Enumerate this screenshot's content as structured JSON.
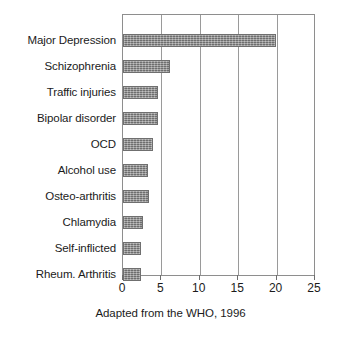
{
  "chart_data": {
    "type": "bar",
    "orientation": "horizontal",
    "title": "",
    "subtitle": "",
    "xlabel": "",
    "ylabel": "",
    "categories": [
      "Major Depression",
      "Schizophrenia",
      "Traffic injuries",
      "Bipolar disorder",
      "OCD",
      "Alcohol use",
      "Osteo-arthritis",
      "Chlamydia",
      "Self-inflicted",
      "Rheum. Arthritis"
    ],
    "values": [
      19.9,
      6.1,
      4.5,
      4.6,
      3.9,
      3.3,
      3.4,
      2.6,
      2.4,
      2.4
    ],
    "xlim": [
      0,
      25
    ],
    "xticks": [
      0,
      5,
      10,
      15,
      20,
      25
    ],
    "xtick_labels": [
      "0",
      "5",
      "10",
      "15",
      "20",
      "25"
    ],
    "grid": true,
    "grid_axis": "x",
    "legend": false,
    "bar_color": "#8c8c8c",
    "bar_edge_color": "#6f6f6f",
    "axis_color": "#8e8e8e",
    "text_color": "#1b1b1b"
  },
  "caption": {
    "text": "Adapted from the WHO, 1996"
  }
}
